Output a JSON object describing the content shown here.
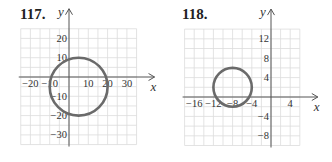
{
  "problems": [
    {
      "number": "117.",
      "x_axis_label": "x",
      "y_axis_label": "y"
    },
    {
      "number": "118.",
      "x_axis_label": "x",
      "y_axis_label": "y"
    }
  ],
  "chart_data": [
    {
      "type": "scatter",
      "title": "117.",
      "xlabel": "x",
      "ylabel": "y",
      "xlim": [
        -25,
        35
      ],
      "ylim": [
        -35,
        25
      ],
      "grid": true,
      "grid_step": 5,
      "x_ticks": [
        -20,
        -10,
        10,
        20,
        30
      ],
      "y_ticks": [
        20,
        10,
        -10,
        -20,
        -30
      ],
      "shapes": [
        {
          "shape": "circle",
          "center": [
            5,
            -5
          ],
          "radius": 15
        }
      ]
    },
    {
      "type": "scatter",
      "title": "118.",
      "xlabel": "x",
      "ylabel": "y",
      "xlim": [
        -18,
        6
      ],
      "ylim": [
        -10,
        14
      ],
      "grid": true,
      "grid_step": 2,
      "x_ticks": [
        -16,
        -12,
        -8,
        -4,
        4
      ],
      "y_ticks": [
        12,
        8,
        4,
        -4,
        -8
      ],
      "shapes": [
        {
          "shape": "circle",
          "center": [
            -8,
            2
          ],
          "radius": 4
        }
      ]
    }
  ]
}
